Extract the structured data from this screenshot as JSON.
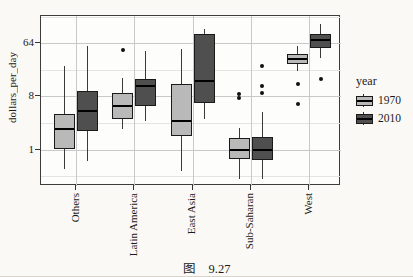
{
  "figure": {
    "caption_prefix": "图",
    "caption_number": "9.27"
  },
  "chart_data": {
    "type": "boxplot",
    "title": "",
    "xlabel": "",
    "ylabel": "dollars_per_day",
    "y_scale": "log2",
    "ylim": [
      0.24,
      186
    ],
    "grid": "major+minor",
    "y_ticks": [
      {
        "value": 1,
        "label": "1"
      },
      {
        "value": 8,
        "label": "8"
      },
      {
        "value": 64,
        "label": "64"
      }
    ],
    "categories": [
      "Others",
      "Latin America",
      "East Asia",
      "Sub-Saharan",
      "West"
    ],
    "legend": {
      "title": "year",
      "position": "right"
    },
    "series": [
      {
        "name": "1970",
        "fill": "#b9b9b9",
        "boxes": [
          {
            "category": "Others",
            "low": 0.47,
            "q1": 1.0,
            "median": 2.2,
            "q3": 4.0,
            "high": 26,
            "outliers": []
          },
          {
            "category": "Latin America",
            "low": 2.2,
            "q1": 3.3,
            "median": 5.5,
            "q3": 9.1,
            "high": 16.4,
            "outliers": [
              49
            ]
          },
          {
            "category": "East Asia",
            "low": 0.43,
            "q1": 1.7,
            "median": 3.05,
            "q3": 13,
            "high": 51,
            "outliers": []
          },
          {
            "category": "Sub-Saharan",
            "low": 0.31,
            "q1": 0.69,
            "median": 1.0,
            "q3": 1.57,
            "high": 2.3,
            "outliers": [
              8.8,
              7.5
            ]
          },
          {
            "category": "West",
            "low": 22,
            "q1": 28,
            "median": 35,
            "q3": 42,
            "high": 58,
            "outliers": [
              13,
              5.9
            ]
          }
        ]
      },
      {
        "name": "2010",
        "fill": "#4f4f4f",
        "boxes": [
          {
            "category": "Others",
            "low": 0.64,
            "q1": 2.1,
            "median": 4.5,
            "q3": 9.9,
            "high": 58,
            "outliers": []
          },
          {
            "category": "Latin America",
            "low": 3.05,
            "q1": 5.5,
            "median": 12,
            "q3": 15.8,
            "high": 47,
            "outliers": []
          },
          {
            "category": "East Asia",
            "low": 3.3,
            "q1": 6.2,
            "median": 14.6,
            "q3": 92,
            "high": 112,
            "outliers": []
          },
          {
            "category": "Sub-Saharan",
            "low": 0.31,
            "q1": 0.66,
            "median": 1.0,
            "q3": 1.63,
            "high": 4.3,
            "outliers": [
              26,
              12,
              9.1
            ]
          },
          {
            "category": "West",
            "low": 36,
            "q1": 53,
            "median": 73,
            "q3": 92,
            "high": 136,
            "outliers": [
              16
            ]
          }
        ]
      }
    ],
    "colors": {
      "box_border": "#1a1a1a",
      "median": "#000000",
      "whisker": "#3a3a3a",
      "outlier": "#111111",
      "grid_major": "#c9c9c9",
      "grid_minor": "#e4e4e2",
      "panel_border": "#3c3c3c",
      "panel_bg": "#fdfdfb",
      "page_bg": "#faf9f5",
      "text": "#1b1b1b"
    }
  }
}
